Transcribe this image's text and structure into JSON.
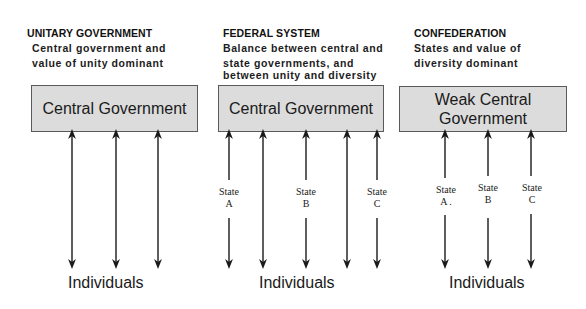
{
  "columns": [
    {
      "id": "unitary",
      "heading": "UNITARY GOVERNMENT",
      "description_lines": [
        "Central government and",
        "value of unity dominant"
      ],
      "box_lines": [
        "Central Government"
      ],
      "states": [],
      "bottom_label": "Individuals"
    },
    {
      "id": "federal",
      "heading": "FEDERAL SYSTEM",
      "description_lines": [
        "Balance between central and",
        "state governments, and",
        "between unity and diversity"
      ],
      "box_lines": [
        "Central Government"
      ],
      "states": [
        {
          "word": "State",
          "letter": "A"
        },
        {
          "word": "State",
          "letter": "B"
        },
        {
          "word": "State",
          "letter": "C"
        }
      ],
      "bottom_label": "Individuals"
    },
    {
      "id": "confederation",
      "heading": "CONFEDERATION",
      "description_lines": [
        "States and value of",
        "diversity dominant"
      ],
      "box_lines": [
        "Weak Central",
        "Government"
      ],
      "states": [
        {
          "word": "State",
          "letter": "A ."
        },
        {
          "word": "State",
          "letter": "B"
        },
        {
          "word": "State",
          "letter": "C"
        }
      ],
      "bottom_label": "Individuals"
    }
  ],
  "colors": {
    "box_fill": "#dcdcdc",
    "box_border": "#5a5a5a",
    "arrow": "#1a1a1a"
  }
}
